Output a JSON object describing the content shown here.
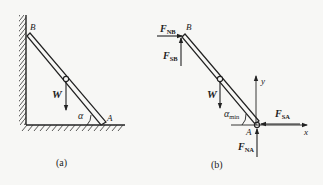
{
  "diagram": {
    "type": "free-body diagram of ladder leaning against wall",
    "panel_a": {
      "caption": "(a)",
      "labels": {
        "top_end": "B",
        "bottom_end": "A",
        "weight": "W",
        "angle": "α"
      }
    },
    "panel_b": {
      "caption": "(b)",
      "labels": {
        "top_end": "B",
        "bottom_end": "A",
        "weight": "W",
        "angle_main": "α",
        "angle_sub": "min",
        "normal_B_main": "F",
        "normal_B_sub": "NB",
        "friction_B_main": "F",
        "friction_B_sub": "SB",
        "friction_A_main": "F",
        "friction_A_sub": "SA",
        "normal_A_main": "F",
        "normal_A_sub": "NA",
        "x_axis": "x",
        "y_axis": "y"
      }
    },
    "colors": {
      "ink": "#222222",
      "background": "#f7f7f5"
    }
  }
}
